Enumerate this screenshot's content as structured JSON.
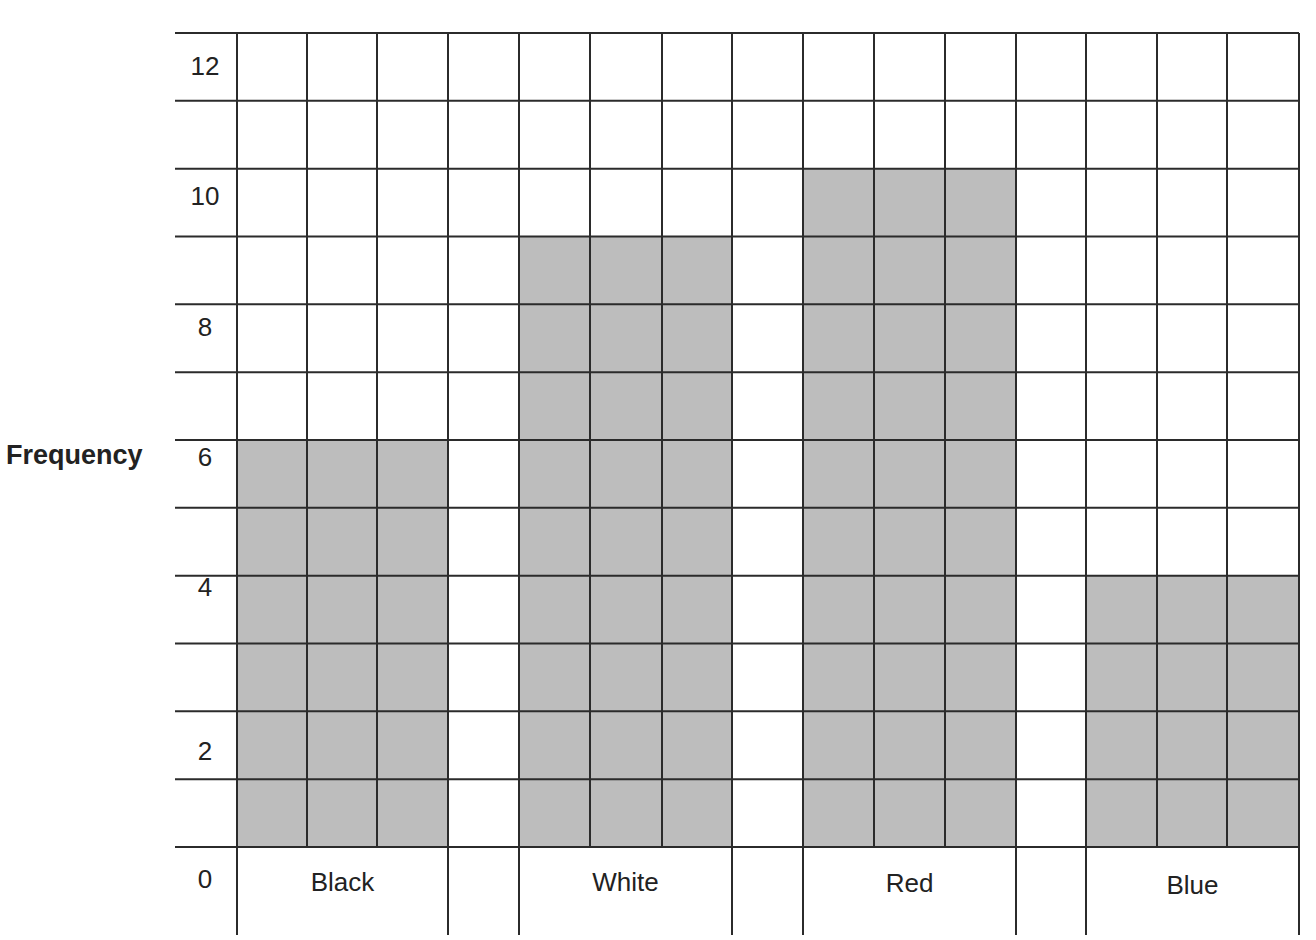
{
  "chart_data": {
    "type": "bar",
    "title": "",
    "xlabel": "",
    "ylabel": "Frequency",
    "categories": [
      "Black",
      "White",
      "Red",
      "Blue"
    ],
    "values": [
      6,
      9,
      10,
      4
    ],
    "ylim": [
      0,
      12
    ],
    "yticks": [
      0,
      2,
      4,
      6,
      8,
      10,
      12
    ],
    "grid": true,
    "legend": null,
    "bar_color": "#bdbdbd",
    "grid_color": "#2b2b2b"
  },
  "axis": {
    "ylabel": "Frequency",
    "ticks": [
      "0",
      "2",
      "4",
      "6",
      "8",
      "10",
      "12"
    ]
  },
  "categories": {
    "black": "Black",
    "white": "White",
    "red": "Red",
    "blue": "Blue"
  }
}
